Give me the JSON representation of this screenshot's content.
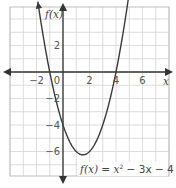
{
  "chart_data": {
    "type": "line",
    "title": "",
    "function_label": "f(x) = x² − 3x − 4",
    "equation_parts": {
      "fx": "f(x)",
      "eq": " = ",
      "x2": "x",
      "sup": "2",
      "rest": " − 3x − 4"
    },
    "xlabel": "x",
    "ylabel": "f(x)",
    "xlim": [
      -4,
      8
    ],
    "ylim": [
      -7.75,
      4.9
    ],
    "grid": true,
    "grid_step": 1,
    "x_ticks": [
      {
        "value": -2,
        "label": "−2"
      },
      {
        "value": 0,
        "label": "0"
      },
      {
        "value": 2,
        "label": "2"
      },
      {
        "value": 4,
        "label": "4"
      },
      {
        "value": 6,
        "label": "6"
      }
    ],
    "y_ticks": [
      {
        "value": 2,
        "label": "2"
      },
      {
        "value": -2,
        "label": "−2"
      },
      {
        "value": -4,
        "label": "−4"
      },
      {
        "value": -6,
        "label": "−6"
      }
    ],
    "series": [
      {
        "name": "f(x) = x^2 - 3x - 4",
        "coefficients": {
          "a": 1,
          "b": -3,
          "c": -4
        },
        "x_domain": [
          -1.9,
          5.0
        ],
        "key_points": {
          "roots": [
            -1,
            4
          ],
          "y_intercept": -4,
          "vertex": [
            1.5,
            -6.25
          ]
        }
      }
    ]
  },
  "colors": {
    "grid": "#d4d4d4",
    "axis": "#333333",
    "curve": "#3a3a3a",
    "border": "#bdbdbd"
  }
}
